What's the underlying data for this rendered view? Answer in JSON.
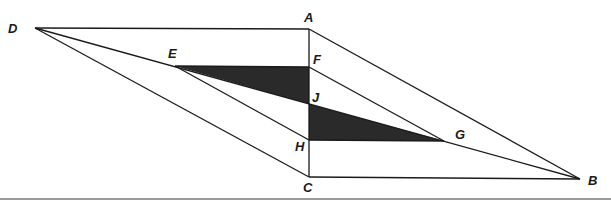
{
  "figure": {
    "line_color": "#1a1a1a",
    "fill_color": "#2a2a2a",
    "rule_color": "#7a7a7a",
    "points": {
      "A": {
        "label": "A",
        "x": 309,
        "y": 29
      },
      "B": {
        "label": "B",
        "x": 580,
        "y": 179
      },
      "C": {
        "label": "C",
        "x": 309,
        "y": 177
      },
      "D": {
        "label": "D",
        "x": 35,
        "y": 28
      },
      "E": {
        "label": "E",
        "x": 175,
        "y": 66
      },
      "F": {
        "label": "F",
        "x": 309,
        "y": 67
      },
      "G": {
        "label": "G",
        "x": 444,
        "y": 141
      },
      "H": {
        "label": "H",
        "x": 309,
        "y": 140
      },
      "J": {
        "label": "J",
        "x": 309,
        "y": 104
      }
    },
    "segments": [
      [
        "D",
        "A"
      ],
      [
        "A",
        "B"
      ],
      [
        "D",
        "C"
      ],
      [
        "C",
        "B"
      ],
      [
        "A",
        "C"
      ],
      [
        "D",
        "B"
      ],
      [
        "E",
        "H"
      ],
      [
        "F",
        "G"
      ],
      [
        "E",
        "F"
      ],
      [
        "H",
        "G"
      ]
    ],
    "shaded_triangles": [
      [
        "E",
        "F",
        "J"
      ],
      [
        "J",
        "H",
        "G"
      ]
    ]
  }
}
